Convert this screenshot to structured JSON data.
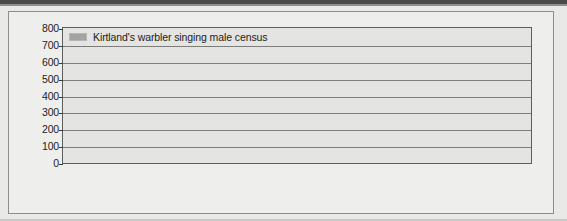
{
  "figure": {
    "legend_label": "Kirtland's warbler singing male census",
    "legend_swatch_name": "legend-color-swatch",
    "bar_color": "#9b9b99",
    "plot_background": "#e4e4e2",
    "page_background": "#e9e9e7"
  },
  "chart_data": {
    "type": "bar",
    "title": "",
    "subtitle": "",
    "xlabel": "",
    "ylabel": "",
    "ylim": [
      0,
      800
    ],
    "ytick_step": 100,
    "yticks": [
      800,
      700,
      600,
      500,
      400,
      300,
      200,
      100,
      0
    ],
    "grid": true,
    "legend_position": "top-left-inside",
    "series_name": "Kirtland's warbler singing male census",
    "categories": [
      "1951",
      "1961",
      "1971",
      "1972",
      "1973",
      "1974",
      "1975",
      "1976",
      "1977",
      "1978",
      "1979",
      "1980",
      "1981",
      "1982",
      "1983",
      "1984",
      "1985",
      "1986",
      "1987",
      "1988",
      "1989",
      "1990",
      "1991",
      "1992",
      "1993",
      "1994",
      "1995",
      "1996"
    ],
    "values": [
      432,
      502,
      201,
      200,
      216,
      167,
      179,
      200,
      219,
      218,
      210,
      242,
      232,
      207,
      215,
      216,
      217,
      210,
      167,
      212,
      212,
      265,
      347,
      397,
      485,
      633,
      765,
      692
    ],
    "values_note": "singing males counted"
  }
}
